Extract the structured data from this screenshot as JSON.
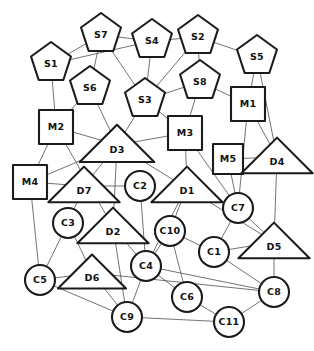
{
  "diagram": {
    "width": 314,
    "height": 351,
    "background_color": "#ffffff",
    "node_fill_color": "#ffffff",
    "node_stroke_color": "#1b1b1b",
    "edge_color": "#5a5a5a",
    "label_color": "#111111",
    "shape_legend": {
      "pentagon": "supplier",
      "square": "manufacturer",
      "triangle": "distributor",
      "circle": "customer"
    }
  },
  "nodes": [
    {
      "id": "S1",
      "label": "S1",
      "shape": "pentagon",
      "x": 51,
      "y": 64,
      "r": 21
    },
    {
      "id": "S2",
      "label": "S2",
      "shape": "pentagon",
      "x": 198,
      "y": 37,
      "r": 21
    },
    {
      "id": "S3",
      "label": "S3",
      "shape": "pentagon",
      "x": 145,
      "y": 100,
      "r": 21
    },
    {
      "id": "S4",
      "label": "S4",
      "shape": "pentagon",
      "x": 152,
      "y": 41,
      "r": 21
    },
    {
      "id": "S5",
      "label": "S5",
      "shape": "pentagon",
      "x": 257,
      "y": 57,
      "r": 21
    },
    {
      "id": "S6",
      "label": "S6",
      "shape": "pentagon",
      "x": 90,
      "y": 88,
      "r": 21
    },
    {
      "id": "S7",
      "label": "S7",
      "shape": "pentagon",
      "x": 101,
      "y": 35,
      "r": 21
    },
    {
      "id": "S8",
      "label": "S8",
      "shape": "pentagon",
      "x": 200,
      "y": 82,
      "r": 21
    },
    {
      "id": "M1",
      "label": "M1",
      "shape": "square",
      "x": 248,
      "y": 104,
      "r": 17
    },
    {
      "id": "M2",
      "label": "M2",
      "shape": "square",
      "x": 56,
      "y": 127,
      "r": 17
    },
    {
      "id": "M3",
      "label": "M3",
      "shape": "square",
      "x": 185,
      "y": 133,
      "r": 17
    },
    {
      "id": "M4",
      "label": "M4",
      "shape": "square",
      "x": 30,
      "y": 182,
      "r": 17
    },
    {
      "id": "M5",
      "label": "M5",
      "shape": "square",
      "x": 228,
      "y": 159,
      "r": 15
    },
    {
      "id": "D1",
      "label": "D1",
      "shape": "triangle",
      "x": 187,
      "y": 186,
      "r": 22
    },
    {
      "id": "D2",
      "label": "D2",
      "shape": "triangle",
      "x": 113,
      "y": 227,
      "r": 22
    },
    {
      "id": "D3",
      "label": "D3",
      "shape": "triangle",
      "x": 117,
      "y": 145,
      "r": 23
    },
    {
      "id": "D4",
      "label": "D4",
      "shape": "triangle",
      "x": 277,
      "y": 157,
      "r": 22
    },
    {
      "id": "D5",
      "label": "D5",
      "shape": "triangle",
      "x": 274,
      "y": 242,
      "r": 22
    },
    {
      "id": "D6",
      "label": "D6",
      "shape": "triangle",
      "x": 92,
      "y": 273,
      "r": 21
    },
    {
      "id": "D7",
      "label": "D7",
      "shape": "triangle",
      "x": 84,
      "y": 186,
      "r": 22
    },
    {
      "id": "C1",
      "label": "C1",
      "shape": "circle",
      "x": 214,
      "y": 252,
      "r": 15
    },
    {
      "id": "C2",
      "label": "C2",
      "shape": "circle",
      "x": 140,
      "y": 186,
      "r": 15
    },
    {
      "id": "C3",
      "label": "C3",
      "shape": "circle",
      "x": 68,
      "y": 223,
      "r": 15
    },
    {
      "id": "C4",
      "label": "C4",
      "shape": "circle",
      "x": 146,
      "y": 266,
      "r": 15
    },
    {
      "id": "C5",
      "label": "C5",
      "shape": "circle",
      "x": 40,
      "y": 280,
      "r": 15
    },
    {
      "id": "C6",
      "label": "C6",
      "shape": "circle",
      "x": 187,
      "y": 297,
      "r": 15
    },
    {
      "id": "C7",
      "label": "C7",
      "shape": "circle",
      "x": 238,
      "y": 208,
      "r": 15
    },
    {
      "id": "C8",
      "label": "C8",
      "shape": "circle",
      "x": 274,
      "y": 292,
      "r": 15
    },
    {
      "id": "C9",
      "label": "C9",
      "shape": "circle",
      "x": 127,
      "y": 317,
      "r": 15
    },
    {
      "id": "C10",
      "label": "C10",
      "shape": "circle",
      "x": 170,
      "y": 231,
      "r": 15
    },
    {
      "id": "C11",
      "label": "C11",
      "shape": "circle",
      "x": 229,
      "y": 322,
      "r": 15
    }
  ],
  "edges": [
    {
      "from": "S1",
      "to": "S7"
    },
    {
      "from": "S1",
      "to": "S4"
    },
    {
      "from": "S1",
      "to": "M2"
    },
    {
      "from": "S7",
      "to": "S4"
    },
    {
      "from": "S7",
      "to": "S6"
    },
    {
      "from": "S7",
      "to": "S3"
    },
    {
      "from": "S4",
      "to": "S2"
    },
    {
      "from": "S4",
      "to": "S3"
    },
    {
      "from": "S2",
      "to": "S5"
    },
    {
      "from": "S2",
      "to": "S8"
    },
    {
      "from": "S2",
      "to": "S3"
    },
    {
      "from": "S8",
      "to": "S3"
    },
    {
      "from": "S8",
      "to": "M3"
    },
    {
      "from": "S8",
      "to": "M1"
    },
    {
      "from": "S5",
      "to": "M1"
    },
    {
      "from": "S5",
      "to": "D4"
    },
    {
      "from": "S6",
      "to": "M2"
    },
    {
      "from": "S6",
      "to": "D3"
    },
    {
      "from": "S3",
      "to": "D3"
    },
    {
      "from": "S3",
      "to": "M3"
    },
    {
      "from": "M2",
      "to": "D3"
    },
    {
      "from": "M2",
      "to": "M4"
    },
    {
      "from": "M2",
      "to": "D2"
    },
    {
      "from": "M3",
      "to": "D3"
    },
    {
      "from": "M3",
      "to": "D1"
    },
    {
      "from": "M3",
      "to": "C7"
    },
    {
      "from": "M1",
      "to": "C7"
    },
    {
      "from": "M1",
      "to": "D4"
    },
    {
      "from": "M5",
      "to": "D4"
    },
    {
      "from": "M5",
      "to": "C7"
    },
    {
      "from": "D4",
      "to": "D5"
    },
    {
      "from": "M4",
      "to": "D7"
    },
    {
      "from": "M4",
      "to": "D3"
    },
    {
      "from": "M4",
      "to": "C5"
    },
    {
      "from": "D3",
      "to": "D7"
    },
    {
      "from": "D3",
      "to": "D2"
    },
    {
      "from": "D3",
      "to": "D5"
    },
    {
      "from": "D7",
      "to": "C2"
    },
    {
      "from": "D7",
      "to": "C3"
    },
    {
      "from": "C2",
      "to": "C4"
    },
    {
      "from": "D2",
      "to": "C4"
    },
    {
      "from": "D2",
      "to": "C9"
    },
    {
      "from": "C3",
      "to": "C5"
    },
    {
      "from": "C3",
      "to": "D6"
    },
    {
      "from": "C5",
      "to": "D6"
    },
    {
      "from": "C5",
      "to": "C9"
    },
    {
      "from": "D6",
      "to": "C9"
    },
    {
      "from": "D1",
      "to": "C10"
    },
    {
      "from": "D1",
      "to": "C4"
    },
    {
      "from": "C10",
      "to": "C4"
    },
    {
      "from": "C10",
      "to": "C1"
    },
    {
      "from": "C10",
      "to": "C6"
    },
    {
      "from": "C4",
      "to": "C9"
    },
    {
      "from": "C4",
      "to": "C6"
    },
    {
      "from": "C4",
      "to": "C8"
    },
    {
      "from": "C7",
      "to": "C1"
    },
    {
      "from": "C7",
      "to": "D5"
    },
    {
      "from": "C1",
      "to": "D5"
    },
    {
      "from": "C1",
      "to": "C8"
    },
    {
      "from": "D5",
      "to": "C8"
    },
    {
      "from": "C6",
      "to": "C11"
    },
    {
      "from": "C9",
      "to": "C11"
    },
    {
      "from": "C11",
      "to": "C8"
    },
    {
      "from": "D6",
      "to": "C8"
    }
  ]
}
